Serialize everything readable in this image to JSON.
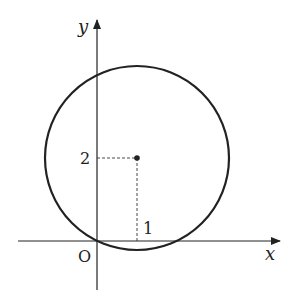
{
  "diagram": {
    "axes": {
      "x_label": "x",
      "y_label": "y",
      "origin_label": "O"
    },
    "circle": {
      "center": [
        1,
        2
      ],
      "passes_through_origin": true
    },
    "ticks": {
      "x_tick_label": "1",
      "y_tick_label": "2"
    },
    "colors": {
      "stroke": "#222222",
      "background": "#ffffff"
    }
  }
}
